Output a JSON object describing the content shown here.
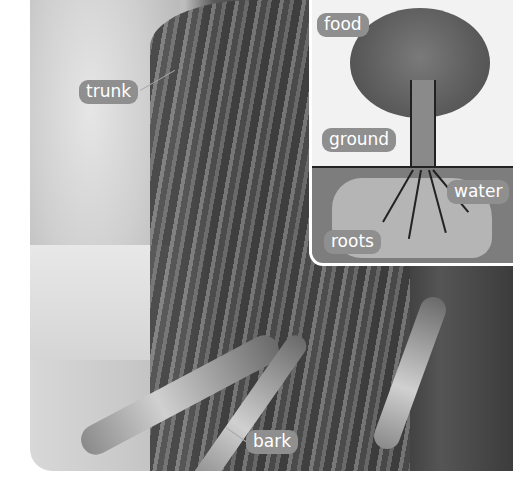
{
  "figure": {
    "photo_labels": [
      {
        "id": "trunk",
        "text": "trunk"
      },
      {
        "id": "bark",
        "text": "bark"
      }
    ],
    "inset": {
      "title": "tree diagram",
      "labels": [
        {
          "id": "food",
          "text": "food"
        },
        {
          "id": "ground",
          "text": "ground"
        },
        {
          "id": "water",
          "text": "water"
        },
        {
          "id": "roots",
          "text": "roots"
        }
      ]
    },
    "colors": {
      "label_bg": "#8f8f8f",
      "label_text": "#ffffff",
      "inset_border": "#ffffff",
      "page_bg": "#ffffff"
    }
  }
}
